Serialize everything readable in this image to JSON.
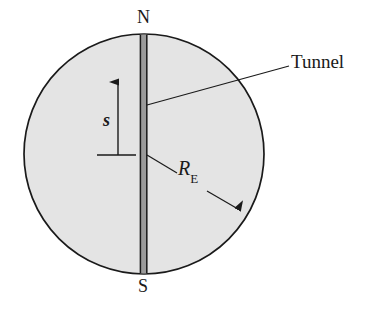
{
  "figure": {
    "labels": {
      "north_pole": "N",
      "south_pole": "S",
      "tunnel": "Tunnel",
      "displacement": "s",
      "radius_symbol": "R",
      "radius_subscript": "E"
    },
    "colors": {
      "earth_fill": "#e4e4e4",
      "tunnel_fill": "#9a9a9a",
      "outline": "#1a1a1a",
      "background": "#ffffff",
      "text": "#1a1a1a"
    },
    "geometry": {
      "earth_center_x": 144,
      "earth_center_y": 154,
      "earth_radius": 120,
      "tunnel_left_x": 140,
      "tunnel_right_x": 147,
      "tunnel_top_y": 35,
      "tunnel_bottom_y": 273,
      "displacement_arrow_tip_y": 72,
      "displacement_baseline_y": 155,
      "displacement_arrow_x": 118,
      "displacement_baseline_x1": 97,
      "displacement_baseline_x2": 136,
      "tunnel_leader_x1": 147,
      "tunnel_leader_y1": 105,
      "tunnel_leader_x2": 289,
      "tunnel_leader_y2": 66,
      "radius_arrow_x1": 147,
      "radius_arrow_y1": 155,
      "radius_arrow_x2": 244,
      "radius_arrow_y2": 213
    }
  }
}
